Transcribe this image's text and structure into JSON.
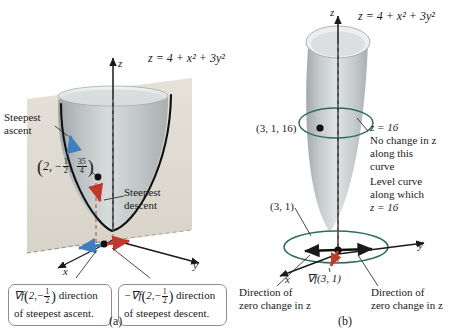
{
  "figure": {
    "panel_a": {
      "id": "(a)",
      "surface_equation": "z = 4 + x² + 3y²",
      "axis_z": "z",
      "axis_x": "x",
      "axis_y": "y",
      "steepest_ascent_label": "Steepest\nascent",
      "steepest_ascent_line1": "Steepest",
      "steepest_ascent_line2": "ascent",
      "steepest_descent_line1": "Steepest",
      "steepest_descent_line2": "descent",
      "point_label_open": "(",
      "point_label_x": "2,",
      "point_label_y_sign": "−",
      "point_label_y_num": "1",
      "point_label_y_den": "2",
      "point_label_y_comma": ",",
      "point_label_z_num": "35",
      "point_label_z_den": "4",
      "point_label_close": ")",
      "callout_ascent_grad": "∇f",
      "callout_ascent_arg_open": "(",
      "callout_ascent_arg_x": "2,",
      "callout_ascent_arg_sign": "−",
      "callout_ascent_arg_num": "1",
      "callout_ascent_arg_den": "2",
      "callout_ascent_arg_close": ")",
      "callout_ascent_tail": " direction",
      "callout_ascent_line2": "of steepest ascent.",
      "callout_descent_grad": "−∇f",
      "callout_descent_arg_open": "(",
      "callout_descent_arg_x": "2,",
      "callout_descent_arg_sign": "−",
      "callout_descent_arg_num": "1",
      "callout_descent_arg_den": "2",
      "callout_descent_arg_close": ")",
      "callout_descent_tail": " direction",
      "callout_descent_line2": "of steepest descent."
    },
    "panel_b": {
      "id": "(b)",
      "surface_equation": "z = 4 + x² + 3y²",
      "axis_z": "z",
      "axis_x": "x",
      "axis_y": "y",
      "point_3d_label": "(3, 1, 16)",
      "point_2d_label": "(3, 1)",
      "level_value_label": "z = 16",
      "no_change_line1": "No change in z",
      "no_change_line2": "along this",
      "no_change_line3": "curve",
      "level_curve_line1": "Level curve",
      "level_curve_line2": "along which",
      "level_curve_line3": "z = 16",
      "gradient_label": "∇f(3, 1)",
      "zero_change_left_line1": "Direction of",
      "zero_change_left_line2": "zero change in z",
      "zero_change_right_line1": "Direction of",
      "zero_change_right_line2": "zero change in z"
    },
    "colors": {
      "surface_light": "#e9ebec",
      "surface_mid": "#c6cacb",
      "surface_dark": "#a7adaf",
      "plane": "#ded9cf",
      "curve_black": "#101010",
      "level_curve_teal": "#2f6b62",
      "arrow_ascent_blue": "#3f7fc1",
      "arrow_descent_red": "#c0392b",
      "dashed_red": "#b5514a",
      "axis": "#1a1a1a",
      "callout_border": "#8d8d8d"
    }
  }
}
